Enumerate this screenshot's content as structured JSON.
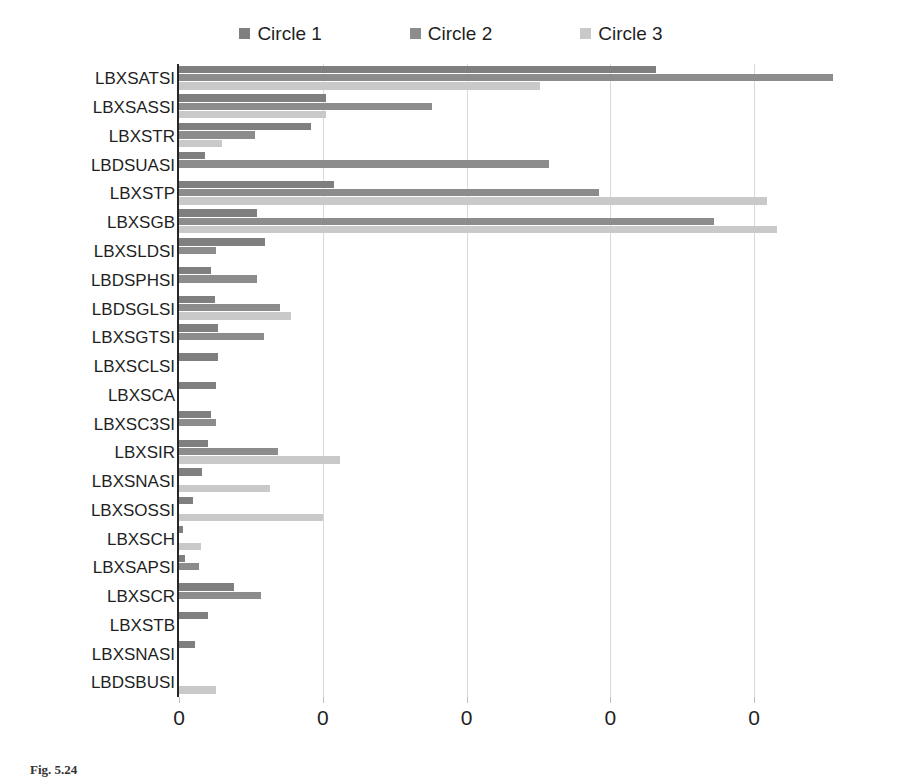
{
  "chart_data": {
    "type": "bar",
    "orientation": "horizontal",
    "title": "",
    "subtitle": "",
    "xlabel": "",
    "ylabel": "",
    "grid": true,
    "legend_position": "top",
    "xlim": [
      0,
      5
    ],
    "x_tick_labels": [
      "0",
      "0",
      "0",
      "0",
      "0"
    ],
    "x_tick_values": [
      0,
      1,
      2,
      3,
      4
    ],
    "categories": [
      "LBXSATSI",
      "LBXSASSI",
      "LBXSTR",
      "LBDSUASI",
      "LBXSTP",
      "LBXSGB",
      "LBXSLDSI",
      "LBDSPHSI",
      "LBDSGLSI",
      "LBXSGTSI",
      "LBXSCLSI",
      "LBXSCA",
      "LBXSC3SI",
      "LBXSIR",
      "LBXSNASI",
      "LBXSOSSI",
      "LBXSCH",
      "LBXSAPSI",
      "LBXSCR",
      "LBXSTB",
      "LBXSNASI",
      "LBDSBUSI"
    ],
    "series": [
      {
        "name": "Circle 1",
        "color": "#7f7f7f",
        "values": [
          3.32,
          1.02,
          0.92,
          0.18,
          1.08,
          0.54,
          0.6,
          0.22,
          0.25,
          0.27,
          0.27,
          0.26,
          0.22,
          0.2,
          0.16,
          0.1,
          0.03,
          0.04,
          0.38,
          0.2,
          0.11,
          0.0
        ]
      },
      {
        "name": "Circle 2",
        "color": "#8c8c8c",
        "values": [
          4.55,
          1.76,
          0.53,
          2.57,
          2.92,
          3.72,
          0.26,
          0.54,
          0.7,
          0.59,
          0.0,
          0.0,
          0.26,
          0.69,
          0.0,
          0.0,
          0.0,
          0.14,
          0.57,
          0.0,
          0.0,
          0.0
        ]
      },
      {
        "name": "Circle 3",
        "color": "#c9c9c9",
        "values": [
          2.51,
          1.02,
          0.3,
          0.0,
          4.09,
          4.16,
          0.0,
          0.0,
          0.78,
          0.0,
          0.0,
          0.0,
          0.0,
          1.12,
          0.63,
          1.0,
          0.15,
          0.0,
          0.0,
          0.0,
          0.0,
          0.26
        ]
      }
    ]
  },
  "legend": {
    "items": [
      {
        "label": "Circle 1",
        "color": "#7f7f7f"
      },
      {
        "label": "Circle 2",
        "color": "#8c8c8c"
      },
      {
        "label": "Circle 3",
        "color": "#c9c9c9"
      }
    ]
  },
  "caption": {
    "text": "Fig. 5.24"
  }
}
